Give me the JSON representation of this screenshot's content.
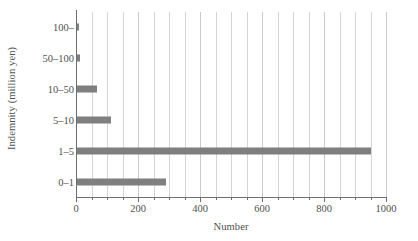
{
  "chart_data": {
    "type": "bar",
    "orientation": "horizontal",
    "title": "",
    "xlabel": "Number",
    "ylabel": "Indemnity (million yen)",
    "categories": [
      "0–1",
      "1–5",
      "5–10",
      "10–50",
      "50–100",
      "100–"
    ],
    "values": [
      288,
      948,
      110,
      64,
      10,
      6
    ],
    "series": [
      {
        "name": "Number",
        "values": [
          288,
          948,
          110,
          64,
          10,
          6
        ]
      }
    ],
    "xlim": [
      0,
      1000
    ],
    "xticks": [
      0,
      200,
      400,
      600,
      800,
      1000
    ],
    "xtick_labels": [
      "0",
      "200",
      "400",
      "600",
      "800",
      "1000"
    ],
    "x_minor_tick_step": 50,
    "ytick_labels_top_to_bottom": [
      "100–",
      "50–100",
      "10–50",
      "5–10",
      "1–5",
      "0–1"
    ],
    "grid": "vertical",
    "legend": "none",
    "bar_color": "#7f7f7f",
    "gridline_color": "#d4d4d4",
    "axis_color": "#6e6e6e",
    "text_color": "#4f4f4f",
    "background_color": "#ffffff"
  }
}
